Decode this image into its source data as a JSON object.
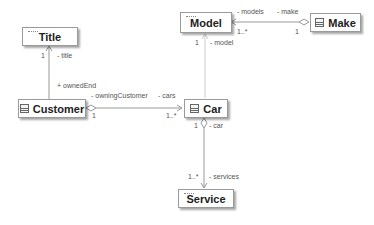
{
  "diagram": {
    "type": "uml-class-diagram",
    "classes": [
      {
        "id": "title",
        "name": "Title",
        "icon": "enumeration-stereotype"
      },
      {
        "id": "customer",
        "name": "Customer",
        "icon": "class-icon"
      },
      {
        "id": "car",
        "name": "Car",
        "icon": "class-icon"
      },
      {
        "id": "model",
        "name": "Model",
        "icon": "enumeration-stereotype"
      },
      {
        "id": "make",
        "name": "Make",
        "icon": "class-icon"
      },
      {
        "id": "service",
        "name": "Service",
        "icon": "enumeration-stereotype"
      }
    ],
    "associations": [
      {
        "from": "customer",
        "to": "title",
        "kind": "navigable",
        "labels": {
          "role_target": "- title",
          "mult_target": "1",
          "role_source": "+ ownedEnd"
        }
      },
      {
        "from": "customer",
        "to": "car",
        "kind": "aggregation",
        "labels": {
          "role_source": "- owningCustomer",
          "mult_source": "1",
          "role_target": "- cars",
          "mult_target": "1..*"
        }
      },
      {
        "from": "make",
        "to": "model",
        "kind": "aggregation",
        "labels": {
          "role_target": "- models",
          "mult_target": "1..*",
          "role_source": "- make",
          "mult_source": "1"
        }
      },
      {
        "from": "car",
        "to": "model",
        "kind": "navigable",
        "labels": {
          "role_target": "- model",
          "mult_target": "1"
        }
      },
      {
        "from": "car",
        "to": "service",
        "kind": "aggregation",
        "labels": {
          "role_source": "- car",
          "mult_source": "1",
          "role_target": "- services",
          "mult_target": "1..*"
        }
      }
    ]
  }
}
